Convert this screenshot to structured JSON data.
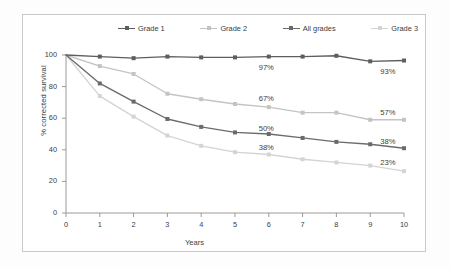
{
  "chart_data": {
    "type": "line",
    "title": "",
    "xlabel": "Years",
    "ylabel": "% corrected survival",
    "xlim": [
      0,
      10
    ],
    "ylim": [
      0,
      100
    ],
    "xticks": [
      "0",
      "1",
      "2",
      "3",
      "4",
      "5",
      "6",
      "7",
      "8",
      "9",
      "10"
    ],
    "yticks": [
      "0",
      "20",
      "40",
      "60",
      "80",
      "100"
    ],
    "grid": false,
    "legend_position": "top",
    "x": [
      0,
      1,
      2,
      3,
      4,
      5,
      6,
      7,
      8,
      9,
      10
    ],
    "series": [
      {
        "name": "Grade 1",
        "color": "#5e5e5e",
        "marker": "square",
        "values": [
          100,
          99,
          98,
          99,
          98.5,
          98.5,
          99,
          99,
          99.5,
          96,
          96.5
        ]
      },
      {
        "name": "Grade 2",
        "color": "#c4c4c4",
        "marker": "square",
        "values": [
          100,
          93,
          88,
          75.5,
          72,
          69,
          67,
          63.5,
          63.5,
          59,
          59
        ]
      },
      {
        "name": "All grades",
        "color": "#6b6b6b",
        "marker": "square",
        "values": [
          100,
          82,
          70.5,
          59.5,
          54.5,
          51,
          50,
          47.5,
          45,
          43.5,
          41
        ]
      },
      {
        "name": "Grade 3",
        "color": "#d4d4d4",
        "marker": "square",
        "values": [
          100,
          74,
          61,
          49,
          42.5,
          38.5,
          37,
          34,
          32,
          30,
          26.5
        ]
      }
    ],
    "annotations": [
      {
        "text": "97%",
        "x": 5.7,
        "y": 92,
        "series": "Grade 1"
      },
      {
        "text": "67%",
        "x": 5.7,
        "y": 72,
        "series": "Grade 2"
      },
      {
        "text": "50%",
        "x": 5.7,
        "y": 53,
        "series": "All grades"
      },
      {
        "text": "38%",
        "x": 5.7,
        "y": 41,
        "series": "Grade 3"
      },
      {
        "text": "93%",
        "x": 9.3,
        "y": 89,
        "series": "Grade 1"
      },
      {
        "text": "57%",
        "x": 9.3,
        "y": 63,
        "series": "Grade 2"
      },
      {
        "text": "38%",
        "x": 9.3,
        "y": 45,
        "series": "All grades"
      },
      {
        "text": "23%",
        "x": 9.3,
        "y": 31.5,
        "series": "Grade 3"
      }
    ]
  },
  "legend": {
    "entries": [
      {
        "label": "Grade 1",
        "color": "#5e5e5e"
      },
      {
        "label": "Grade 2",
        "color": "#c4c4c4"
      },
      {
        "label": "All grades",
        "color": "#6b6b6b"
      },
      {
        "label": "Grade 3",
        "color": "#d4d4d4"
      }
    ]
  },
  "axes": {
    "x_title": "Years",
    "y_title": "% corrected survival",
    "axis_color": "#9a9a9a",
    "text_color": "#3d3d3d"
  }
}
